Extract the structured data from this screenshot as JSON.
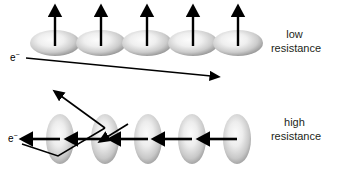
{
  "figure": {
    "background_color": "#ffffff",
    "ink_color": "#000000",
    "domain_grain_color_light": "#f8f8f8",
    "domain_grain_color_dark": "#8c8c8c"
  },
  "panels": [
    {
      "id": "low-resistance",
      "label_line1": "low",
      "label_line2": "resistance",
      "label_x": 296,
      "label_y": 38,
      "electron_symbol": "e",
      "electron_charge": "−",
      "electron_label_x": 10,
      "electron_label_y": 61,
      "domain_orientation": "aligned-up",
      "domain_shape": "ellipse-horizontal",
      "domains": [
        {
          "cx": 55,
          "cy": 43,
          "rx": 25,
          "ry": 13,
          "arrow_x": 55,
          "arrow_y0": 46,
          "arrow_y1": 12
        },
        {
          "cx": 101,
          "cy": 43,
          "rx": 25,
          "ry": 13,
          "arrow_x": 101,
          "arrow_y0": 46,
          "arrow_y1": 12
        },
        {
          "cx": 147,
          "cy": 43,
          "rx": 25,
          "ry": 13,
          "arrow_x": 147,
          "arrow_y0": 46,
          "arrow_y1": 12
        },
        {
          "cx": 193,
          "cy": 43,
          "rx": 25,
          "ry": 13,
          "arrow_x": 193,
          "arrow_y0": 46,
          "arrow_y1": 12
        },
        {
          "cx": 238,
          "cy": 43,
          "rx": 25,
          "ry": 13,
          "arrow_x": 238,
          "arrow_y0": 46,
          "arrow_y1": 12
        }
      ],
      "electron_path": "M 26,58 L 213,77"
    },
    {
      "id": "high-resistance",
      "label_line1": "high",
      "label_line2": "resistance",
      "label_x": 296,
      "label_y": 126,
      "electron_symbol": "e",
      "electron_charge": "−",
      "electron_label_x": 8,
      "electron_label_y": 142,
      "domain_orientation": "aligned-left",
      "domain_shape": "ellipse-vertical",
      "domains": [
        {
          "cx": 60,
          "cy": 139,
          "rx": 14,
          "ry": 25,
          "arrow_x0": 60,
          "arrow_x1": 28,
          "arrow_y": 139
        },
        {
          "cx": 105,
          "cy": 139,
          "rx": 14,
          "ry": 25,
          "arrow_x0": 105,
          "arrow_x1": 73,
          "arrow_y": 139
        },
        {
          "cx": 148,
          "cy": 139,
          "rx": 14,
          "ry": 25,
          "arrow_x0": 148,
          "arrow_x1": 116,
          "arrow_y": 139
        },
        {
          "cx": 192,
          "cy": 139,
          "rx": 14,
          "ry": 25,
          "arrow_x0": 192,
          "arrow_x1": 160,
          "arrow_y": 139
        },
        {
          "cx": 237,
          "cy": 139,
          "rx": 14,
          "ry": 25,
          "arrow_x0": 237,
          "arrow_x1": 205,
          "arrow_y": 139
        }
      ],
      "electron_path_segment_1": "M 124,125 L 104,128",
      "electron_path_segment_2": "M 104,128 L 60,95",
      "electron_path_scatter": "M 22,144 L 58,156 L 104,128",
      "scatter_vertices": [
        [
          124,
          125
        ],
        [
          104,
          128
        ],
        [
          60,
          95
        ],
        [
          22,
          144
        ],
        [
          58,
          156
        ]
      ]
    }
  ],
  "arrows": {
    "head_length": 8,
    "head_width": 6,
    "shaft_width_domain": 2.4,
    "shaft_width_electron": 1.6
  }
}
